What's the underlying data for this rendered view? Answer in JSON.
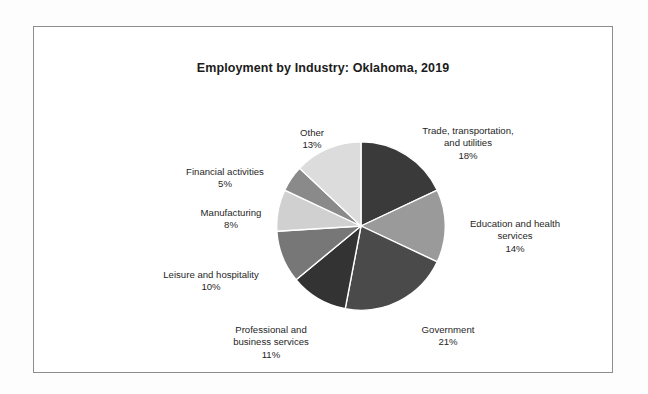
{
  "chart_data": {
    "type": "pie",
    "title": "Employment by Industry: Oklahoma, 2019",
    "xlabel": "",
    "ylabel": "",
    "legend": "none",
    "grid": false,
    "units": "percent",
    "start_angle_deg": 0,
    "direction": "clockwise",
    "categories": [
      "Trade, transportation, and utilities",
      "Education and health services",
      "Government",
      "Professional and business services",
      "Leisure and hospitality",
      "Manufacturing",
      "Financial activities",
      "Other"
    ],
    "values": [
      18,
      14,
      21,
      11,
      10,
      8,
      5,
      13
    ],
    "slices": [
      {
        "name": "Trade, transportation, and utilities",
        "label_line1": "Trade, transportation,",
        "label_line2": "and utilities",
        "value": 18,
        "pct_text": "18%",
        "color": "#3a3a3a"
      },
      {
        "name": "Education and health services",
        "label_line1": "Education and health",
        "label_line2": "services",
        "value": 14,
        "pct_text": "14%",
        "color": "#9a9a9a"
      },
      {
        "name": "Government",
        "label_line1": "Government",
        "label_line2": "",
        "value": 21,
        "pct_text": "21%",
        "color": "#4a4a4a"
      },
      {
        "name": "Professional and business services",
        "label_line1": "Professional and",
        "label_line2": "business services",
        "value": 11,
        "pct_text": "11%",
        "color": "#333333"
      },
      {
        "name": "Leisure and hospitality",
        "label_line1": "Leisure and hospitality",
        "label_line2": "",
        "value": 10,
        "pct_text": "10%",
        "color": "#777777"
      },
      {
        "name": "Manufacturing",
        "label_line1": "Manufacturing",
        "label_line2": "",
        "value": 8,
        "pct_text": "8%",
        "color": "#d0d0d0"
      },
      {
        "name": "Financial activities",
        "label_line1": "Financial activities",
        "label_line2": "",
        "value": 5,
        "pct_text": "5%",
        "color": "#8a8a8a"
      },
      {
        "name": "Other",
        "label_line1": "Other",
        "label_line2": "",
        "value": 13,
        "pct_text": "13%",
        "color": "#dcdcdc"
      }
    ]
  },
  "figure": {
    "border_color": "#8d8d8d",
    "background_color": "#ffffff",
    "slice_separator_color": "#ffffff"
  }
}
